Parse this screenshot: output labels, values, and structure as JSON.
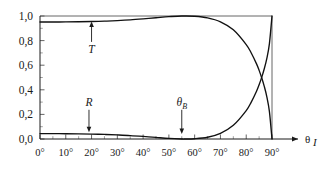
{
  "chart_data": {
    "type": "line",
    "title": "",
    "xlabel": "θᵢ",
    "ylabel": "",
    "xlim": [
      0,
      90
    ],
    "ylim": [
      0,
      1
    ],
    "grid": false,
    "legend_position": "none",
    "x_tick_labels": [
      "0°",
      "10°",
      "20°",
      "30°",
      "40°",
      "50°",
      "60°",
      "70°",
      "80°",
      "90°"
    ],
    "x_tick_values": [
      0,
      10,
      20,
      30,
      40,
      50,
      60,
      70,
      80,
      90
    ],
    "y_tick_labels": [
      "0,0",
      "0,2",
      "0,4",
      "0,6",
      "0,8",
      "1,0"
    ],
    "y_tick_values": [
      0.0,
      0.2,
      0.4,
      0.6,
      0.8,
      1.0
    ],
    "x_minor_interval": 5,
    "y_minor_interval": 0.1,
    "x": [
      0,
      5,
      10,
      15,
      20,
      25,
      30,
      35,
      40,
      45,
      50,
      55,
      56,
      60,
      65,
      70,
      75,
      80,
      82,
      84,
      85,
      86,
      87,
      88,
      89,
      90
    ],
    "series": [
      {
        "name": "T",
        "label": "T",
        "values": [
          0.951,
          0.951,
          0.952,
          0.953,
          0.955,
          0.958,
          0.963,
          0.969,
          0.977,
          0.986,
          0.995,
          1.0,
          1.0,
          0.998,
          0.985,
          0.953,
          0.888,
          0.768,
          0.697,
          0.611,
          0.558,
          0.498,
          0.428,
          0.343,
          0.223,
          0.0
        ]
      },
      {
        "name": "R",
        "label": "R",
        "values": [
          0.044,
          0.044,
          0.043,
          0.042,
          0.04,
          0.037,
          0.033,
          0.028,
          0.021,
          0.013,
          0.005,
          0.0,
          0.0,
          0.002,
          0.014,
          0.046,
          0.111,
          0.231,
          0.302,
          0.388,
          0.441,
          0.501,
          0.571,
          0.656,
          0.776,
          1.0
        ]
      }
    ],
    "annotations": [
      {
        "id": "t-annotation",
        "label": "T",
        "x": 20,
        "arrow": "up",
        "label_y": 0.7,
        "target_y": 0.955
      },
      {
        "id": "r-annotation",
        "label": "R",
        "x": 19,
        "arrow": "down",
        "label_y": 0.27,
        "target_y": 0.055
      },
      {
        "id": "brewster-annotation",
        "label": "θʙ",
        "label_html": "θ",
        "subscript": "B",
        "x": 55,
        "arrow": "down",
        "label_y": 0.27,
        "target_y": 0.04
      }
    ],
    "axis_title": {
      "symbol": "θ",
      "subscript": "I"
    },
    "colors": {
      "curve": "#111111",
      "frame": "#555555",
      "axis": "#1a1a1a",
      "background": "#ffffff"
    }
  }
}
